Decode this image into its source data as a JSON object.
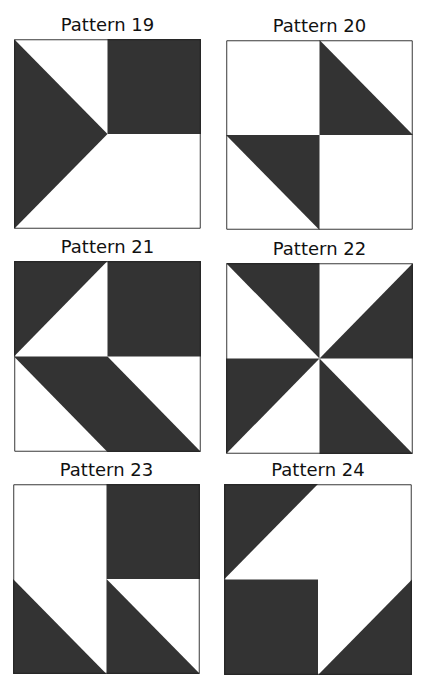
{
  "figure": {
    "fill_color": "#333333",
    "background_color": "#ffffff",
    "border_color": "#222222"
  },
  "patterns": [
    {
      "title": "Pattern 19",
      "box": {
        "x": 14,
        "y": 39,
        "w": 187,
        "h": 190
      },
      "shapes": [
        {
          "points": "0,0 50,50 0,100"
        },
        {
          "points": "50,0 100,0 100,50 50,50"
        }
      ]
    },
    {
      "title": "Pattern 20",
      "box": {
        "x": 226,
        "y": 40,
        "w": 187,
        "h": 190
      },
      "shapes": [
        {
          "points": "50,0 100,50 50,50"
        },
        {
          "points": "0,50 50,50 50,100"
        }
      ]
    },
    {
      "title": "Pattern 21",
      "box": {
        "x": 14,
        "y": 261,
        "w": 187,
        "h": 191
      },
      "shapes": [
        {
          "points": "0,0 50,0 0,50"
        },
        {
          "points": "50,0 100,0 100,50 50,50"
        },
        {
          "points": "0,50 50,50 100,100 50,100"
        }
      ]
    },
    {
      "title": "Pattern 22",
      "box": {
        "x": 226,
        "y": 263,
        "w": 187,
        "h": 191
      },
      "shapes": [
        {
          "points": "0,0 50,0 50,50"
        },
        {
          "points": "100,0 100,50 50,50"
        },
        {
          "points": "0,50 50,50 0,100"
        },
        {
          "points": "50,50 100,100 50,100"
        }
      ]
    },
    {
      "title": "Pattern 23",
      "box": {
        "x": 13,
        "y": 484,
        "w": 187,
        "h": 190
      },
      "shapes": [
        {
          "points": "50,0 100,0 100,50 50,50"
        },
        {
          "points": "0,50 50,100 0,100"
        },
        {
          "points": "50,50 100,100 50,100"
        }
      ]
    },
    {
      "title": "Pattern 24",
      "box": {
        "x": 224,
        "y": 484,
        "w": 188,
        "h": 191
      },
      "shapes": [
        {
          "points": "0,0 50,0 0,50"
        },
        {
          "points": "0,50 50,50 50,100 0,100"
        },
        {
          "points": "100,50 100,100 50,100"
        }
      ]
    }
  ]
}
